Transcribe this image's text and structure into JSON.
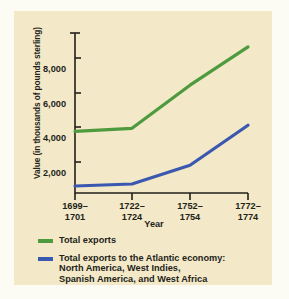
{
  "chart_data": {
    "type": "line",
    "title": "",
    "xlabel": "Year",
    "ylabel": "Value (in thousands of pounds sterling)",
    "categories": [
      "1699–\n1701",
      "1722–\n1724",
      "1752–\n1754",
      "1772–\n1774"
    ],
    "ytick_labels": [
      "2,000",
      "4,000",
      "6,000",
      "8,000"
    ],
    "ytick_values": [
      2000,
      4000,
      6000,
      8000
    ],
    "ylim": [
      0,
      9200
    ],
    "grid": false,
    "legend_position": "below",
    "series": [
      {
        "name": "Total exports",
        "color": "#4e9a3f",
        "values": [
          3550,
          3720,
          6200,
          8400
        ]
      },
      {
        "name": "Total exports to the Atlantic economy:\nNorth America, West Indies,\nSpanish America, and West Africa",
        "color": "#3b58b0",
        "values": [
          400,
          520,
          1600,
          3900
        ]
      }
    ]
  },
  "colors": {
    "panel_background": "#f3e9c8",
    "page_background": "#fdfcf4",
    "axis": "#231f1a",
    "text": "#231f1a",
    "series_total_exports": "#4e9a3f",
    "series_atlantic": "#3b58b0"
  }
}
